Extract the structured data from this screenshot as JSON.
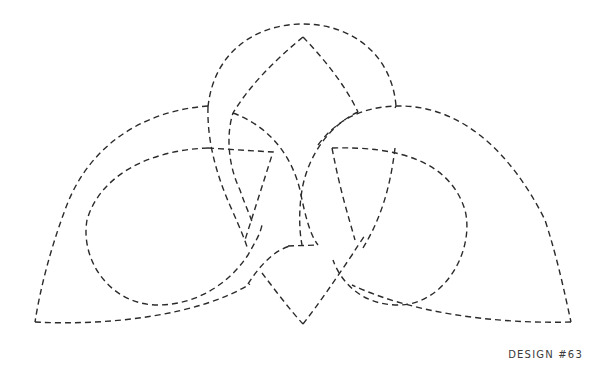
{
  "design": {
    "label": "DESIGN #63",
    "type": "celtic-knot-line-art",
    "stroke_color": "#2b2b2b",
    "background_color": "#ffffff",
    "line_style": "dashed"
  }
}
